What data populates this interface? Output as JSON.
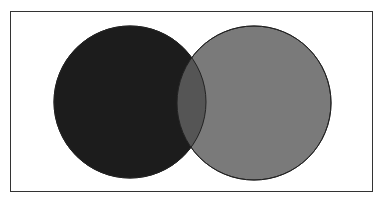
{
  "diagram": {
    "type": "venn",
    "sets": [
      {
        "name": "left-set",
        "cx": 130,
        "cy": 102,
        "r": 76,
        "fill": "#1c1c1c"
      },
      {
        "name": "right-set",
        "cx": 254,
        "cy": 103,
        "r": 77,
        "fill": "#7a7a7a"
      }
    ],
    "overlap_fill": "#555555",
    "stroke": "#222222"
  }
}
